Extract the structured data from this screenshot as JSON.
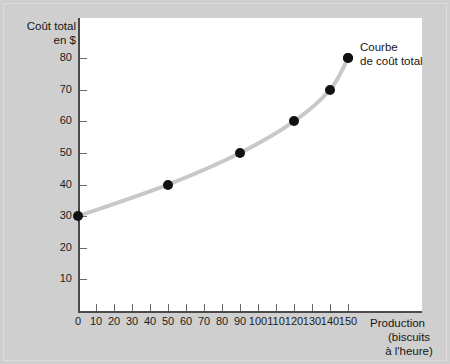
{
  "chart_data": {
    "type": "line",
    "title": "",
    "ylabel": "Coût total en $",
    "ylabel_lines": [
      "Coût total",
      "en $"
    ],
    "xlabel": "Production (biscuits à l'heure)",
    "xlabel_lines": [
      "Production",
      "(biscuits",
      "à l'heure)"
    ],
    "x": [
      0,
      50,
      90,
      120,
      140,
      150
    ],
    "values": [
      30,
      40,
      50,
      60,
      70,
      80
    ],
    "series": [
      {
        "name": "Courbe de coût total",
        "x": [
          0,
          50,
          90,
          120,
          140,
          150
        ],
        "values": [
          30,
          40,
          50,
          60,
          70,
          80
        ]
      }
    ],
    "xlim": [
      0,
      160
    ],
    "ylim": [
      0,
      85
    ],
    "xticks": [
      0,
      10,
      20,
      30,
      40,
      50,
      60,
      70,
      80,
      90,
      100,
      110,
      120,
      130,
      140,
      150
    ],
    "yticks": [
      10,
      20,
      30,
      40,
      50,
      60,
      70,
      80
    ],
    "xtick_labels": [
      "0",
      "10",
      "20",
      "30",
      "40",
      "50",
      "60",
      "70",
      "80",
      "90",
      "100",
      "110",
      "120",
      "130",
      "140",
      "150"
    ],
    "ytick_labels": [
      "10",
      "20",
      "30",
      "40",
      "50",
      "60",
      "70",
      "80"
    ],
    "grid": false,
    "legend_position": "inside-top-right",
    "annotations": [
      {
        "text": "Courbe de coût total",
        "lines": [
          "Courbe",
          "de coût total"
        ],
        "marker": true
      }
    ],
    "colors": {
      "curve": "#c8c8c8",
      "marker": "#111111",
      "axis": "#4a4a4a",
      "panel": "#ffffff",
      "background": "#cfcfcf",
      "text": "#161616"
    }
  }
}
